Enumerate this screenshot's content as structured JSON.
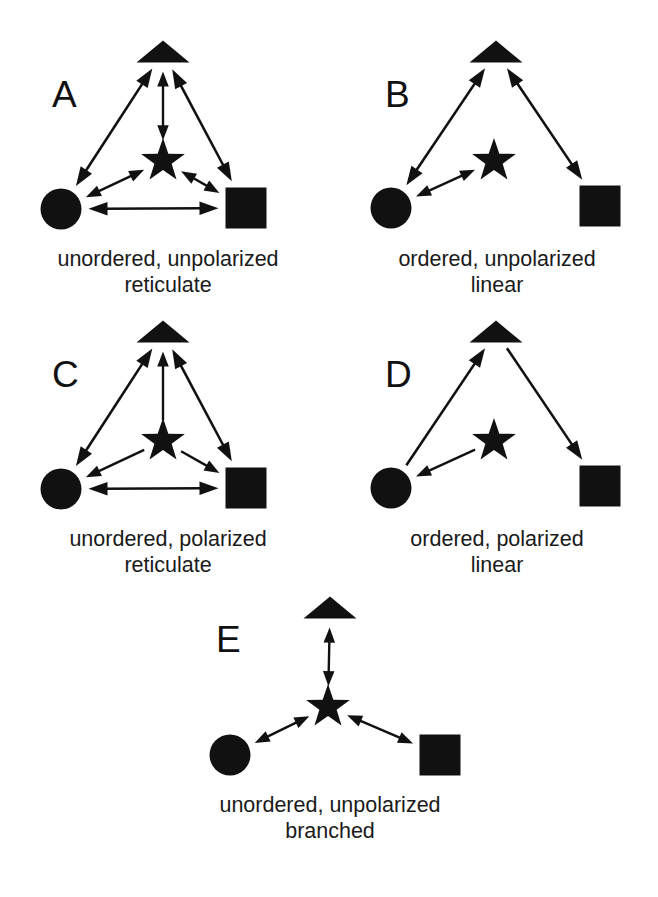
{
  "figure": {
    "background_color": "#ffffff",
    "ink_color": "#111111",
    "width": 658,
    "height": 897,
    "glyph_legend": {
      "triangle": "triangle-glyph",
      "star": "star-glyph",
      "circle": "circle-glyph",
      "square": "square-glyph"
    }
  },
  "panels": [
    {
      "id": "A",
      "letter": "A",
      "letter_pos": {
        "x": 52,
        "y": 107
      },
      "caption": {
        "lines": [
          "unordered, unpolarized",
          "reticulate"
        ],
        "x": 168,
        "y1": 266,
        "y2": 292
      },
      "nodes": [
        {
          "name": "triangle",
          "shape": "triangle",
          "cx": 163,
          "cy": 52,
          "size": 53
        },
        {
          "name": "star",
          "shape": "star",
          "cx": 163,
          "cy": 161,
          "size": 46
        },
        {
          "name": "circle",
          "shape": "circle",
          "cx": 61,
          "cy": 209,
          "size": 41
        },
        {
          "name": "square",
          "shape": "square",
          "cx": 246,
          "cy": 208,
          "size": 41
        }
      ],
      "connections": [
        {
          "name": "circle-triangle",
          "from": "circle",
          "to": "triangle",
          "heads": "both"
        },
        {
          "name": "triangle-square",
          "from": "triangle",
          "to": "square",
          "heads": "both"
        },
        {
          "name": "circle-square",
          "from": "circle",
          "to": "square",
          "heads": "both"
        },
        {
          "name": "star-triangle",
          "from": "star",
          "to": "triangle",
          "heads": "both"
        },
        {
          "name": "star-circle",
          "from": "star",
          "to": "circle",
          "heads": "both"
        },
        {
          "name": "star-square",
          "from": "star",
          "to": "square",
          "heads": "both"
        }
      ]
    },
    {
      "id": "B",
      "letter": "B",
      "letter_pos": {
        "x": 385,
        "y": 107
      },
      "caption": {
        "lines": [
          "ordered, unpolarized",
          "linear"
        ],
        "x": 497,
        "y1": 266,
        "y2": 292
      },
      "nodes": [
        {
          "name": "triangle",
          "shape": "triangle",
          "cx": 496,
          "cy": 52,
          "size": 53
        },
        {
          "name": "star",
          "shape": "star",
          "cx": 494,
          "cy": 161,
          "size": 46
        },
        {
          "name": "circle",
          "shape": "circle",
          "cx": 391,
          "cy": 208,
          "size": 41
        },
        {
          "name": "square",
          "shape": "square",
          "cx": 600,
          "cy": 206,
          "size": 41
        }
      ],
      "connections": [
        {
          "name": "circle-triangle",
          "from": "circle",
          "to": "triangle",
          "heads": "both"
        },
        {
          "name": "triangle-square",
          "from": "triangle",
          "to": "square",
          "heads": "both"
        },
        {
          "name": "star-circle",
          "from": "star",
          "to": "circle",
          "heads": "both"
        }
      ]
    },
    {
      "id": "C",
      "letter": "C",
      "letter_pos": {
        "x": 52,
        "y": 387
      },
      "caption": {
        "lines": [
          "unordered, polarized",
          "reticulate"
        ],
        "x": 168,
        "y1": 546,
        "y2": 572
      },
      "nodes": [
        {
          "name": "triangle",
          "shape": "triangle",
          "cx": 163,
          "cy": 332,
          "size": 53
        },
        {
          "name": "star",
          "shape": "star",
          "cx": 163,
          "cy": 441,
          "size": 46
        },
        {
          "name": "circle",
          "shape": "circle",
          "cx": 61,
          "cy": 489,
          "size": 41
        },
        {
          "name": "square",
          "shape": "square",
          "cx": 246,
          "cy": 488,
          "size": 41
        }
      ],
      "connections": [
        {
          "name": "circle-triangle",
          "from": "circle",
          "to": "triangle",
          "heads": "both"
        },
        {
          "name": "triangle-square",
          "from": "triangle",
          "to": "square",
          "heads": "both"
        },
        {
          "name": "circle-square",
          "from": "circle",
          "to": "square",
          "heads": "both"
        },
        {
          "name": "star-triangle",
          "from": "star",
          "to": "triangle",
          "heads": "end"
        },
        {
          "name": "star-circle",
          "from": "star",
          "to": "circle",
          "heads": "end"
        },
        {
          "name": "star-square",
          "from": "star",
          "to": "square",
          "heads": "end"
        }
      ]
    },
    {
      "id": "D",
      "letter": "D",
      "letter_pos": {
        "x": 385,
        "y": 387
      },
      "caption": {
        "lines": [
          "ordered, polarized",
          "linear"
        ],
        "x": 497,
        "y1": 546,
        "y2": 572
      },
      "nodes": [
        {
          "name": "triangle",
          "shape": "triangle",
          "cx": 496,
          "cy": 332,
          "size": 53
        },
        {
          "name": "star",
          "shape": "star",
          "cx": 494,
          "cy": 441,
          "size": 46
        },
        {
          "name": "circle",
          "shape": "circle",
          "cx": 391,
          "cy": 488,
          "size": 41
        },
        {
          "name": "square",
          "shape": "square",
          "cx": 600,
          "cy": 486,
          "size": 41
        }
      ],
      "connections": [
        {
          "name": "circle-triangle",
          "from": "circle",
          "to": "triangle",
          "heads": "end"
        },
        {
          "name": "triangle-square",
          "from": "triangle",
          "to": "square",
          "heads": "end"
        },
        {
          "name": "star-circle",
          "from": "star",
          "to": "circle",
          "heads": "end"
        }
      ]
    },
    {
      "id": "E",
      "letter": "E",
      "letter_pos": {
        "x": 216,
        "y": 652
      },
      "caption": {
        "lines": [
          "unordered, unpolarized",
          "branched"
        ],
        "x": 330,
        "y1": 812,
        "y2": 838
      },
      "nodes": [
        {
          "name": "triangle",
          "shape": "triangle",
          "cx": 330,
          "cy": 608,
          "size": 53
        },
        {
          "name": "star",
          "shape": "star",
          "cx": 328,
          "cy": 707,
          "size": 46
        },
        {
          "name": "circle",
          "shape": "circle",
          "cx": 230,
          "cy": 755,
          "size": 41
        },
        {
          "name": "square",
          "shape": "square",
          "cx": 440,
          "cy": 755,
          "size": 41
        }
      ],
      "connections": [
        {
          "name": "star-triangle",
          "from": "star",
          "to": "triangle",
          "heads": "both"
        },
        {
          "name": "star-circle",
          "from": "star",
          "to": "circle",
          "heads": "both"
        },
        {
          "name": "star-square",
          "from": "star",
          "to": "square",
          "heads": "both"
        }
      ]
    }
  ]
}
